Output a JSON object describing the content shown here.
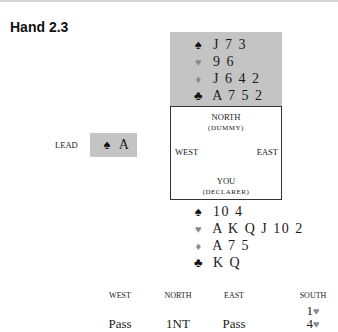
{
  "title": "Hand 2.3",
  "dummy": {
    "spades": "J 7 3",
    "hearts": "9 6",
    "diamonds": "J 6 4 2",
    "clubs": "A 7 5 2"
  },
  "table": {
    "north": "NORTH",
    "north_sub": "(DUMMY)",
    "west": "WEST",
    "east": "EAST",
    "south": "YOU",
    "south_sub": "(DECLARER)"
  },
  "lead": {
    "label": "LEAD",
    "card": "A",
    "suit": "spade"
  },
  "declarer": {
    "spades": "10 4",
    "hearts": "A K Q J 10 2",
    "diamonds": "A 7 5",
    "clubs": "K Q"
  },
  "suits": {
    "spade": "♠",
    "heart": "♥",
    "diamond": "♦",
    "club": "♣"
  },
  "auction": {
    "headers": [
      "WEST",
      "NORTH",
      "EAST",
      "SOUTH"
    ],
    "rounds": [
      [
        "",
        "",
        "",
        "1♥"
      ],
      [
        "Pass",
        "1NT",
        "Pass",
        "4♥"
      ]
    ]
  }
}
